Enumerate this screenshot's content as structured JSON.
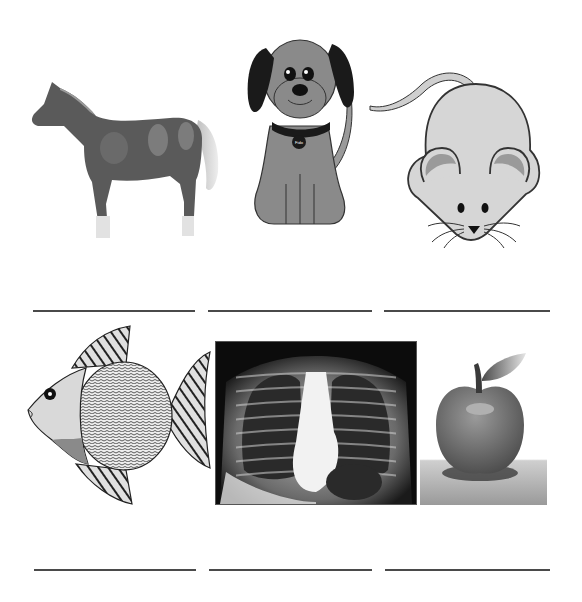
{
  "worksheet": {
    "rows": [
      {
        "items": [
          {
            "picture": "horse",
            "answer": ""
          },
          {
            "picture": "dog",
            "answer": ""
          },
          {
            "picture": "mouse",
            "answer": ""
          }
        ]
      },
      {
        "items": [
          {
            "picture": "fish",
            "answer": ""
          },
          {
            "picture": "chest-x-ray",
            "answer": ""
          },
          {
            "picture": "apple",
            "answer": ""
          }
        ]
      }
    ],
    "dog_tag_text": "Fido"
  },
  "colors": {
    "background": "#ffffff",
    "line": "#4a4a4a",
    "horse": "#5a5a5a",
    "dog_body": "#8a8a8a",
    "dog_ears": "#1a1a1a",
    "mouse_body": "#d6d6d6",
    "mouse_ear_inner": "#9a9a9a",
    "fish_body": "#e6e6e6",
    "xray_bg": "#0c0c0c",
    "apple": "#7c7c7c"
  }
}
